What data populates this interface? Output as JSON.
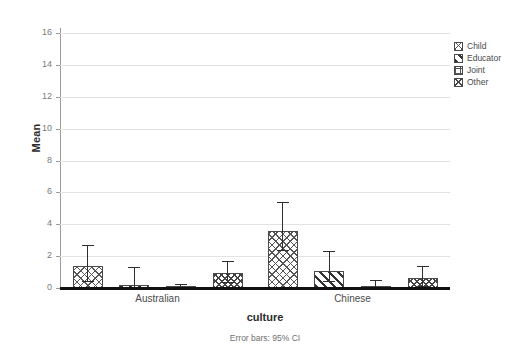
{
  "chart_data": {
    "type": "bar",
    "title": "",
    "xlabel": "culture",
    "ylabel": "Mean",
    "categories": [
      "Australian",
      "Chinese"
    ],
    "ylim": [
      0,
      16
    ],
    "yticks": [
      0,
      2,
      4,
      6,
      8,
      10,
      12,
      14,
      16
    ],
    "ytick_labels": [
      "0",
      "2",
      "4",
      "6",
      "8",
      "10",
      "12",
      "14",
      "16"
    ],
    "grid": true,
    "legend_position": "top-right",
    "error_bar_note": "Error bars: 95% CI",
    "series": [
      {
        "name": "Child",
        "pattern": "dotted-cross",
        "values": [
          1.35,
          3.6
        ],
        "err_low": [
          0.45,
          2.4
        ],
        "err_high": [
          2.7,
          5.4
        ]
      },
      {
        "name": "Educator",
        "pattern": "diagonal-hatch",
        "values": [
          0.22,
          1.05
        ],
        "err_low": [
          0.05,
          0.45
        ],
        "err_high": [
          1.3,
          2.3
        ]
      },
      {
        "name": "Joint",
        "pattern": "grid-crosshatch",
        "values": [
          0.06,
          0.1
        ],
        "err_low": [
          0.0,
          0.0
        ],
        "err_high": [
          0.25,
          0.5
        ]
      },
      {
        "name": "Other",
        "pattern": "dense-crosshatch",
        "values": [
          0.95,
          0.6
        ],
        "err_low": [
          0.35,
          0.1
        ],
        "err_high": [
          1.7,
          1.4
        ]
      }
    ]
  },
  "axis": {
    "y_title": "Mean",
    "x_title": "culture"
  },
  "footnote": {
    "text": "Error bars: 95% CI"
  },
  "legend": {
    "items": [
      {
        "label": "Child"
      },
      {
        "label": "Educator"
      },
      {
        "label": "Joint"
      },
      {
        "label": "Other"
      }
    ]
  }
}
